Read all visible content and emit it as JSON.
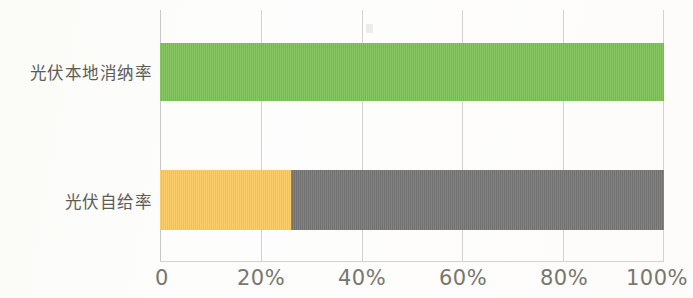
{
  "chart_data": {
    "type": "bar",
    "orientation": "horizontal",
    "title": "",
    "subtitle": "",
    "xlabel": "",
    "ylabel": "",
    "categories": [
      "光伏本地消纳率",
      "光伏自给率"
    ],
    "series": [
      {
        "name": "光伏本地消纳率",
        "values": [
          100,
          null
        ],
        "color": "#7ac152"
      },
      {
        "name": "光伏自给率",
        "values": [
          null,
          26
        ],
        "color": "#fac85a"
      },
      {
        "name": "剩余",
        "values": [
          null,
          74
        ],
        "color": "#757575"
      }
    ],
    "stacked": true,
    "bars": [
      {
        "category": "光伏本地消纳率",
        "segments": [
          {
            "label": "光伏本地消纳率",
            "value": 100,
            "color": "#7ac152"
          }
        ],
        "total": 100
      },
      {
        "category": "光伏自给率",
        "segments": [
          {
            "label": "光伏自给率",
            "value": 26,
            "color": "#fac85a"
          },
          {
            "label": "剩余",
            "value": 74,
            "color": "#757575"
          }
        ],
        "total": 100
      }
    ],
    "xlim": [
      0,
      100
    ],
    "xticks": [
      0,
      20,
      40,
      60,
      80,
      100
    ],
    "xtick_labels": [
      "0",
      "20%",
      "40%",
      "60%",
      "80%",
      "100%"
    ],
    "grid": true,
    "grid_axis": "x",
    "legend": false,
    "legend_position": "none",
    "annotations": [],
    "axis_label_color": "#77776f",
    "category_label_color": "#5b5b58",
    "gridline_color": "#d2d2cf",
    "background_color": "#fdfdfc"
  }
}
